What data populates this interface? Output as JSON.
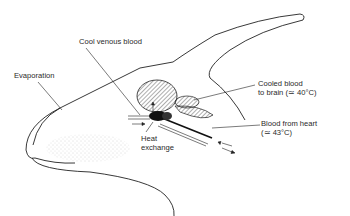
{
  "diagram": {
    "labels": {
      "cool_venous_blood": "Cool venous blood",
      "evaporation": "Evaporation",
      "cooled_blood_line1": "Cooled blood",
      "cooled_blood_line2": "to brain (≃ 40°C)",
      "heat_exchange_line1": "Heat",
      "heat_exchange_line2": "exchange",
      "blood_from_heart_line1": "Blood from heart",
      "blood_from_heart_line2": "(≃ 43°C)"
    },
    "colors": {
      "line": "#222222",
      "stipple": "#bbbbbb",
      "hatch": "#333333",
      "rete": "#111111"
    }
  }
}
